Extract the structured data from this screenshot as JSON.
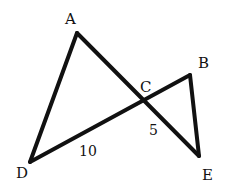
{
  "diagram": {
    "type": "geometry",
    "stroke_color": "#111111",
    "points": {
      "A": {
        "label": "A",
        "x": 77,
        "y": 33
      },
      "B": {
        "label": "B",
        "x": 190,
        "y": 75
      },
      "C": {
        "label": "C",
        "x": 143,
        "y": 100
      },
      "D": {
        "label": "D",
        "x": 30,
        "y": 162
      },
      "E": {
        "label": "E",
        "x": 199,
        "y": 156
      }
    },
    "segments": [
      {
        "from": "A",
        "to": "D"
      },
      {
        "from": "A",
        "to": "E"
      },
      {
        "from": "D",
        "to": "B"
      },
      {
        "from": "B",
        "to": "E"
      }
    ],
    "measurements": [
      {
        "segment": "DC",
        "value": "10"
      },
      {
        "segment": "CE",
        "value": "5"
      }
    ]
  }
}
